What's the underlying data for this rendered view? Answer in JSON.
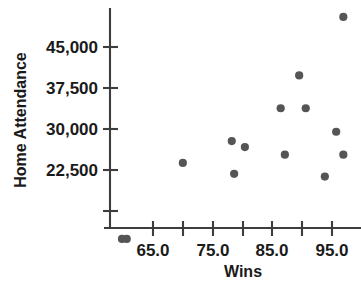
{
  "chart_data": {
    "type": "scatter",
    "title": "",
    "xlabel": "Wins",
    "ylabel": "Home Attendance",
    "xlim": [
      58,
      99
    ],
    "ylim": [
      8000,
      52000
    ],
    "grid": false,
    "legend": null,
    "x_ticks": [
      {
        "value": 65.0,
        "label": "65.0"
      },
      {
        "value": 70.0,
        "label": ""
      },
      {
        "value": 75.0,
        "label": "75.0"
      },
      {
        "value": 80.0,
        "label": ""
      },
      {
        "value": 85.0,
        "label": "85.0"
      },
      {
        "value": 90.0,
        "label": ""
      },
      {
        "value": 95.0,
        "label": "95.0"
      }
    ],
    "y_ticks": [
      {
        "value": 22500,
        "label": "22,500"
      },
      {
        "value": 30000,
        "label": "30,000"
      },
      {
        "value": 37500,
        "label": "37,500"
      },
      {
        "value": 45000,
        "label": "45,000"
      },
      {
        "value": 15000,
        "label": ""
      },
      {
        "value": 50000,
        "label": ""
      }
    ],
    "marker_color": "#555555",
    "marker_size": 4.1,
    "points": [
      {
        "x": 59.8,
        "y": 9900
      },
      {
        "x": 60.6,
        "y": 9900
      },
      {
        "x": 70.0,
        "y": 23800
      },
      {
        "x": 78.2,
        "y": 27800
      },
      {
        "x": 78.6,
        "y": 21800
      },
      {
        "x": 80.4,
        "y": 26700
      },
      {
        "x": 86.4,
        "y": 33800
      },
      {
        "x": 87.1,
        "y": 25300
      },
      {
        "x": 89.5,
        "y": 39800
      },
      {
        "x": 90.6,
        "y": 33800
      },
      {
        "x": 93.8,
        "y": 21300
      },
      {
        "x": 95.7,
        "y": 29500
      },
      {
        "x": 96.9,
        "y": 25300
      },
      {
        "x": 96.9,
        "y": 50500
      }
    ]
  },
  "axis": {
    "x_title": "Wins",
    "y_title": "Home Attendance"
  }
}
